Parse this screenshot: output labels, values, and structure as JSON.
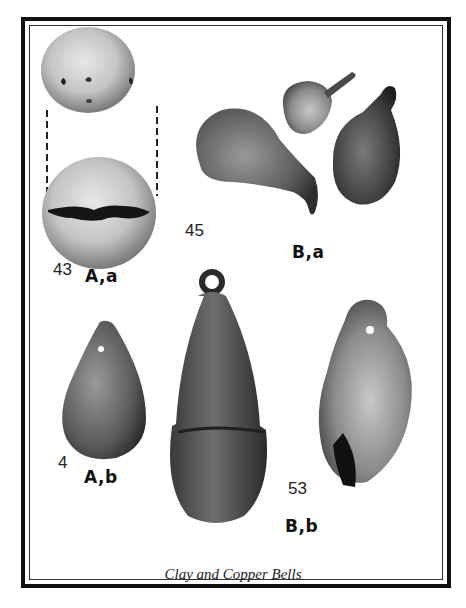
{
  "figure": {
    "caption": "Clay and Copper Bells",
    "groups": [
      {
        "id": "A,a",
        "label": "A,a",
        "number": "43",
        "description": "clay ball bell, top and side views"
      },
      {
        "id": "B,a",
        "label": "B,a",
        "number": "45",
        "description": "three small copper bells"
      },
      {
        "id": "A,b",
        "label": "A,b",
        "number": "4",
        "description": "clay pear-shaped bell with hole"
      },
      {
        "id": "B,b",
        "label": "B,b",
        "number": "53",
        "description": "two large copper bells with loops"
      }
    ]
  }
}
